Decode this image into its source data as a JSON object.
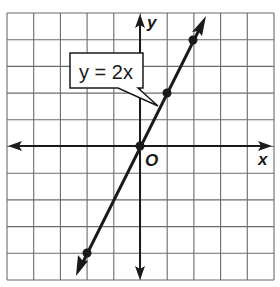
{
  "chart_data": {
    "type": "line",
    "title": "",
    "equation_label": "y = 2x",
    "xlabel": "x",
    "ylabel": "y",
    "origin_label": "O",
    "xlim": [
      -5,
      5
    ],
    "ylim": [
      -5,
      5
    ],
    "grid": true,
    "grid_step": 1,
    "series": [
      {
        "name": "y = 2x",
        "x": [
          -2,
          0,
          1,
          2
        ],
        "y": [
          -4,
          0,
          2,
          4
        ],
        "marked_points": [
          [
            -2,
            -4
          ],
          [
            0,
            0
          ],
          [
            1,
            2
          ],
          [
            2,
            4
          ]
        ]
      }
    ],
    "annotations": [
      {
        "text": "y = 2x",
        "points_to": [
          1,
          2
        ]
      }
    ]
  },
  "labels": {
    "x_axis": "x",
    "y_axis": "y",
    "origin": "O",
    "callout": "y = 2x"
  },
  "colors": {
    "grid": "#6b6b6b",
    "axis": "#1a1a1a",
    "line": "#1a1a1a",
    "background": "#ffffff"
  }
}
